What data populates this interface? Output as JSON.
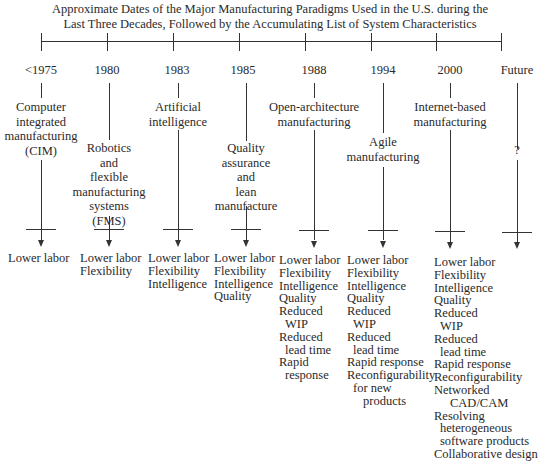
{
  "title": {
    "line1": "Approximate Dates of the Major Manufacturing Paradigms Used in the U.S. during the",
    "line2": "Last Three Decades, Followed by the Accumulating List of System Characteristics"
  },
  "columns": [
    {
      "year": "<1975",
      "paradigm": [
        "Computer",
        "integrated",
        "manufacturing",
        "(CIM)"
      ],
      "characteristics": [
        "Lower labor"
      ]
    },
    {
      "year": "1980",
      "paradigm": [
        "Robotics",
        "and",
        "flexible",
        "manufacturing",
        "systems",
        "(FMS)"
      ],
      "characteristics": [
        "Lower labor",
        "Flexibility"
      ]
    },
    {
      "year": "1983",
      "paradigm": [
        "Artificial",
        "intelligence"
      ],
      "characteristics": [
        "Lower labor",
        "Flexibility",
        "Intelligence"
      ]
    },
    {
      "year": "1985",
      "paradigm": [
        "Quality",
        "assurance",
        "and",
        "lean",
        "manufacture"
      ],
      "characteristics": [
        "Lower labor",
        "Flexibility",
        "Intelligence",
        "Quality"
      ]
    },
    {
      "year": "1988",
      "paradigm": [
        "Open-architecture",
        "manufacturing"
      ],
      "characteristics": [
        "Lower labor",
        "Flexibility",
        "Intelligence",
        "Quality",
        "Reduced",
        "WIP",
        "Reduced",
        "lead time",
        "Rapid",
        "response"
      ]
    },
    {
      "year": "1994",
      "paradigm": [
        "Agile",
        "manufacturing"
      ],
      "characteristics": [
        "Lower labor",
        "Flexibility",
        "Intelligence",
        "Quality",
        "Reduced",
        "WIP",
        "Reduced",
        "lead time",
        "Rapid response",
        "Reconfigurability",
        "for new",
        "products"
      ]
    },
    {
      "year": "2000",
      "paradigm": [
        "Internet-based",
        "manufacturing"
      ],
      "characteristics": [
        "Lower labor",
        "Flexibility",
        "Intelligence",
        "Quality",
        "Reduced",
        "WIP",
        "Reduced",
        "lead time",
        "Rapid response",
        "Reconfigurability",
        "Networked",
        "CAD/CAM",
        "Resolving",
        "heterogeneous",
        "software products",
        "Collaborative design"
      ]
    },
    {
      "year": "Future",
      "paradigm": [
        "?"
      ],
      "characteristics": []
    }
  ]
}
